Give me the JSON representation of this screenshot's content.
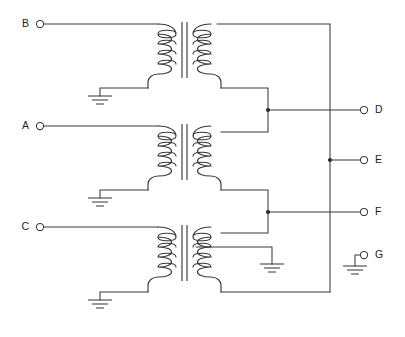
{
  "diagram": {
    "type": "electrical-schematic",
    "line_color": "#3a3a3a",
    "background_color": "#ffffff",
    "junction_color": "#2b2b2b"
  },
  "terminals": {
    "left": [
      {
        "id": "B",
        "label": "B",
        "x": 36,
        "y": 24,
        "side": "left"
      },
      {
        "id": "A",
        "label": "A",
        "x": 36,
        "y": 126,
        "side": "left"
      },
      {
        "id": "C",
        "label": "C",
        "x": 36,
        "y": 227,
        "side": "left"
      }
    ],
    "right": [
      {
        "id": "D",
        "label": "D",
        "x": 368,
        "y": 110,
        "side": "right"
      },
      {
        "id": "E",
        "label": "E",
        "x": 368,
        "y": 160,
        "side": "right"
      },
      {
        "id": "F",
        "label": "F",
        "x": 368,
        "y": 212,
        "side": "right"
      },
      {
        "id": "G",
        "label": "G",
        "x": 368,
        "y": 255,
        "side": "right"
      }
    ]
  },
  "transformers": [
    {
      "name": "transformer-top",
      "input_terminal": "B",
      "primary_turns": 4,
      "secondary_turns": 4,
      "primary_grounded": true,
      "secondary_center_tap_grounded": false
    },
    {
      "name": "transformer-middle",
      "input_terminal": "A",
      "primary_turns": 4,
      "secondary_turns": 4,
      "primary_grounded": true,
      "secondary_center_tap_grounded": false
    },
    {
      "name": "transformer-bottom",
      "input_terminal": "C",
      "primary_turns": 4,
      "secondary_turns": 4,
      "primary_grounded": true,
      "secondary_center_tap_grounded": true
    }
  ],
  "junctions": [
    {
      "name": "junction-d-tap",
      "x": 268,
      "y": 110
    },
    {
      "name": "junction-e-bus",
      "x": 330,
      "y": 160
    },
    {
      "name": "junction-f-tap",
      "x": 268,
      "y": 212
    }
  ],
  "crossings": [
    {
      "name": "crossing-d-over-bus",
      "x": 330,
      "y": 110,
      "connected": false
    },
    {
      "name": "crossing-f-over-bus",
      "x": 330,
      "y": 212,
      "connected": false
    }
  ],
  "grounds": [
    {
      "name": "ground-primary-top",
      "x": 100,
      "y": 96
    },
    {
      "name": "ground-primary-middle",
      "x": 100,
      "y": 198
    },
    {
      "name": "ground-primary-bottom",
      "x": 100,
      "y": 300
    },
    {
      "name": "ground-secondary-bottom-tap",
      "x": 272,
      "y": 272
    },
    {
      "name": "ground-terminal-g",
      "x": 355,
      "y": 266
    }
  ],
  "nets": [
    {
      "name": "net-b-primary-top",
      "from": "B",
      "to": "transformer-top.primary.top"
    },
    {
      "name": "net-a-primary-middle",
      "from": "A",
      "to": "transformer-middle.primary.top"
    },
    {
      "name": "net-c-primary-bottom",
      "from": "C",
      "to": "transformer-bottom.primary.top"
    },
    {
      "name": "net-secondary-bus",
      "from": "transformer-top.secondary.top",
      "to": "transformer-bottom.secondary.bottom"
    },
    {
      "name": "net-d",
      "from": "junction-d-tap",
      "to": "D"
    },
    {
      "name": "net-e",
      "from": "junction-e-bus",
      "to": "E"
    },
    {
      "name": "net-f",
      "from": "junction-f-tap",
      "to": "F"
    },
    {
      "name": "net-g",
      "from": "ground-terminal-g",
      "to": "G"
    }
  ]
}
